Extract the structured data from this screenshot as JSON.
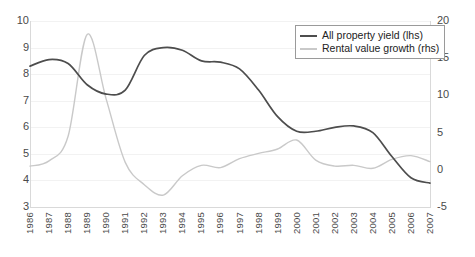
{
  "chart_data": {
    "type": "line",
    "title": "",
    "subtitle": "",
    "xlabel": "",
    "ylabel": "",
    "grid": true,
    "legend_position": "top-right",
    "x": [
      1986,
      1987,
      1988,
      1989,
      1990,
      1991,
      1992,
      1993,
      1994,
      1995,
      1996,
      1997,
      1998,
      1999,
      2000,
      2001,
      2002,
      2003,
      2004,
      2005,
      2006,
      2007
    ],
    "categories": [
      "1986",
      "1987",
      "1988",
      "1989",
      "1990",
      "1991",
      "1992",
      "1993",
      "1994",
      "1995",
      "1996",
      "1997",
      "1998",
      "1999",
      "2000",
      "2001",
      "2002",
      "2003",
      "2004",
      "2005",
      "2006",
      "2007"
    ],
    "axes": {
      "left": {
        "label": "All property yield (lhs)",
        "ylim": [
          3,
          10
        ],
        "ticks": [
          3,
          4,
          5,
          6,
          7,
          8,
          9,
          10
        ],
        "tick_labels": [
          "3",
          "4",
          "5",
          "6",
          "7",
          "8",
          "9",
          "10"
        ]
      },
      "right": {
        "label": "Rental value growth (rhs)",
        "ylim": [
          -5,
          20
        ],
        "ticks": [
          -5,
          0,
          5,
          10,
          15,
          20
        ],
        "tick_labels": [
          "-5",
          "0",
          "5",
          "10",
          "15",
          "20"
        ]
      }
    },
    "series": [
      {
        "name": "All property yield (lhs)",
        "axis": "left",
        "color": "#4d4d4d",
        "values": [
          8.3,
          8.55,
          8.4,
          7.6,
          7.25,
          7.4,
          8.7,
          9.0,
          8.9,
          8.5,
          8.45,
          8.2,
          7.4,
          6.4,
          5.85,
          5.85,
          6.0,
          6.05,
          5.8,
          4.9,
          4.1,
          3.9
        ]
      },
      {
        "name": "Rental value growth (rhs)",
        "axis": "right",
        "color": "#c9c9c9",
        "values": [
          0.5,
          1.2,
          4.5,
          18.2,
          9.5,
          1.0,
          -2.0,
          -3.4,
          -0.8,
          0.6,
          0.3,
          1.5,
          2.2,
          2.8,
          4.0,
          1.3,
          0.5,
          0.6,
          0.2,
          1.4,
          1.9,
          1.1
        ]
      }
    ]
  },
  "legend": {
    "entries": [
      {
        "label": "All property yield (lhs)",
        "color": "#4d4d4d"
      },
      {
        "label": "Rental value growth (rhs)",
        "color": "#c9c9c9"
      }
    ]
  }
}
